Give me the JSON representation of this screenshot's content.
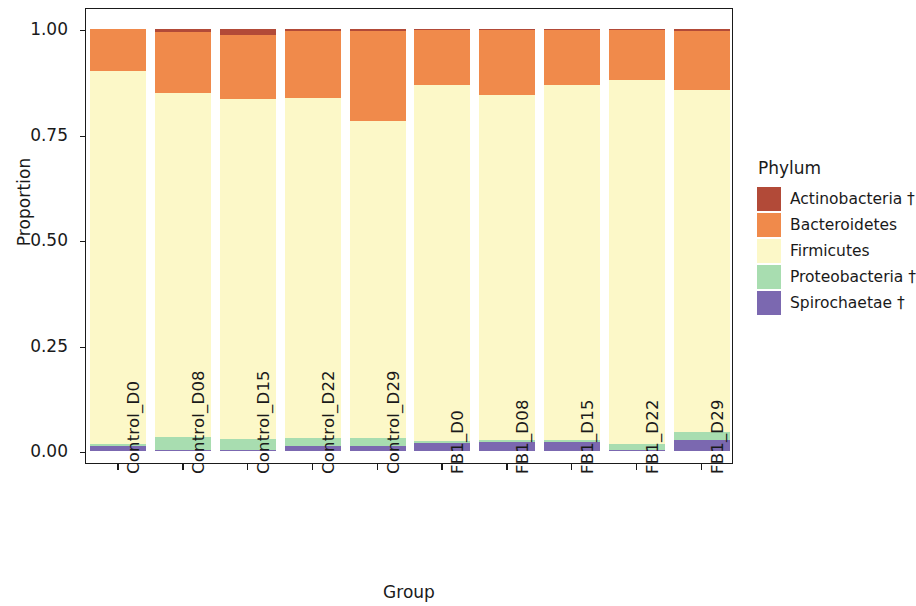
{
  "chart_data": {
    "type": "bar",
    "subtype": "stacked-bar-proportion",
    "title": "",
    "xlabel": "Group",
    "ylabel": "Proportion",
    "ylim": [
      0,
      1
    ],
    "y_ticks": [
      "0.00",
      "0.25",
      "0.50",
      "0.75",
      "1.00"
    ],
    "y_tick_values": [
      0.0,
      0.25,
      0.5,
      0.75,
      1.0
    ],
    "grid": false,
    "legend_position": "right",
    "legend_title": "Phylum",
    "categories": [
      "Control_D0",
      "Control_D08",
      "Control_D15",
      "Control_D22",
      "Control_D29",
      "FB1_D0",
      "FB1_D08",
      "FB1_D15",
      "FB1_D22",
      "FB1_D29"
    ],
    "series": [
      {
        "name": "Spirochaetae †",
        "color": "#7B68B0",
        "values": [
          0.012,
          0.002,
          0.003,
          0.012,
          0.013,
          0.019,
          0.021,
          0.021,
          0.003,
          0.026
        ]
      },
      {
        "name": "Proteobacteria †",
        "color": "#A8DDB0",
        "values": [
          0.005,
          0.031,
          0.026,
          0.019,
          0.019,
          0.004,
          0.005,
          0.006,
          0.014,
          0.019
        ]
      },
      {
        "name": "Firmicutes",
        "color": "#FCF8C8",
        "values": [
          0.883,
          0.816,
          0.805,
          0.805,
          0.75,
          0.845,
          0.818,
          0.84,
          0.862,
          0.81
        ]
      },
      {
        "name": "Bacteroidetes",
        "color": "#F08A4B",
        "values": [
          0.1,
          0.144,
          0.152,
          0.159,
          0.213,
          0.131,
          0.154,
          0.131,
          0.12,
          0.14
        ]
      },
      {
        "name": "Actinobacteria †",
        "color": "#B24A38",
        "values": [
          0.0,
          0.007,
          0.014,
          0.005,
          0.005,
          0.001,
          0.002,
          0.002,
          0.001,
          0.005
        ]
      }
    ]
  },
  "legend": {
    "title": "Phylum",
    "items": [
      {
        "label": "Actinobacteria †",
        "color": "#B24A38"
      },
      {
        "label": "Bacteroidetes",
        "color": "#F08A4B"
      },
      {
        "label": "Firmicutes",
        "color": "#FCF8C8"
      },
      {
        "label": "Proteobacteria †",
        "color": "#A8DDB0"
      },
      {
        "label": "Spirochaetae †",
        "color": "#7B68B0"
      }
    ]
  },
  "axes": {
    "y_title": "Proportion",
    "x_title": "Group"
  }
}
